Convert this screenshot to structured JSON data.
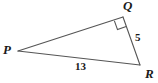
{
  "figure": {
    "type": "right-triangle-diagram",
    "background_color": "#ffffff",
    "stroke_color": "#555555",
    "label_color": "#1a1a1a",
    "vertices": [
      {
        "id": "P",
        "label": "P",
        "x": 18,
        "y": 51
      },
      {
        "id": "Q",
        "label": "Q",
        "x": 123,
        "y": 17
      },
      {
        "id": "R",
        "label": "R",
        "x": 140,
        "y": 65
      }
    ],
    "sides": [
      {
        "id": "PQ",
        "from": "P",
        "to": "Q",
        "label": ""
      },
      {
        "id": "QR",
        "from": "Q",
        "to": "R",
        "label": "5"
      },
      {
        "id": "PR",
        "from": "P",
        "to": "R",
        "label": "13"
      }
    ],
    "right_angle": {
      "at_vertex": "Q",
      "marker": "square",
      "size": 9
    },
    "measures": {
      "QR": "5",
      "PR": "13"
    }
  }
}
